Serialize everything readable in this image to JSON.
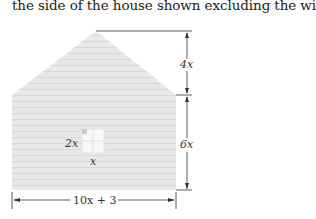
{
  "caption": "the side of the house shown excluding the window.",
  "figure": {
    "roof_height_label": "4x",
    "wall_height_label": "6x",
    "width_label": "10x + 3",
    "window_height_label": "2x",
    "window_width_label": "x",
    "colors": {
      "siding": "#e6e6e6",
      "siding_line": "#d6d6d6",
      "window": "#f7f7f7",
      "dimension_line": "#333333"
    }
  }
}
